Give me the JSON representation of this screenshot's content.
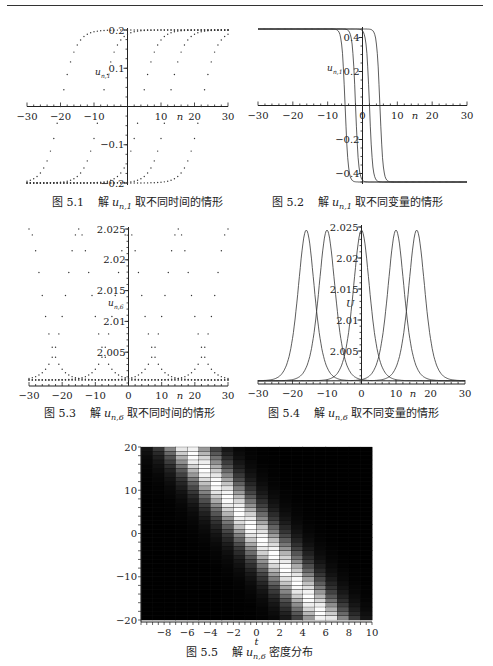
{
  "page": {
    "header_rule": true
  },
  "figures": [
    {
      "id": "5.1",
      "caption_num": "图 5.1",
      "caption_pre": "解",
      "caption_var": "u",
      "caption_sub": "n,1",
      "caption_post": "取不同时间的情形"
    },
    {
      "id": "5.2",
      "caption_num": "图 5.2",
      "caption_pre": "解",
      "caption_var": "u",
      "caption_sub": "n,1",
      "caption_post": "取不同变量的情形"
    },
    {
      "id": "5.3",
      "caption_num": "图 5.3",
      "caption_pre": "解",
      "caption_var": "u",
      "caption_sub": "n,6",
      "caption_post": "取不同时间的情形"
    },
    {
      "id": "5.4",
      "caption_num": "图 5.4",
      "caption_pre": "解",
      "caption_var": "u",
      "caption_sub": "n,6",
      "caption_post": "取不同变量的情形"
    },
    {
      "id": "5.5",
      "caption_num": "图 5.5",
      "caption_pre": "解",
      "caption_var": "u",
      "caption_sub": "n,6",
      "caption_post": "密度分布"
    }
  ],
  "chart_data": [
    {
      "figure": "5.1",
      "type": "scatter",
      "title": "图 5.1 解 u_{n,1} 取不同时间的情形",
      "xlabel": "n",
      "ylabel": "u_{n,1}",
      "xlim": [
        -30,
        30
      ],
      "ylim": [
        -0.2,
        0.2
      ],
      "xticks": [
        -30,
        -20,
        -10,
        10,
        20,
        30
      ],
      "yticks": [
        -0.2,
        -0.1,
        0.1,
        0.2
      ],
      "series": [
        {
          "name": "kink centered n≈-20",
          "center": -20,
          "amplitude": 0.2,
          "style": "dotted"
        },
        {
          "name": "kink centered n≈-8",
          "center": -8,
          "amplitude": 0.2,
          "style": "dotted"
        },
        {
          "name": "kink centered n≈4",
          "center": 4,
          "amplitude": 0.2,
          "style": "dotted"
        },
        {
          "name": "kink centered n≈12",
          "center": 12,
          "amplitude": 0.2,
          "style": "dotted"
        },
        {
          "name": "kink centered n≈22",
          "center": 22,
          "amplitude": 0.2,
          "style": "dotted"
        }
      ],
      "grid": false
    },
    {
      "figure": "5.2",
      "type": "line",
      "title": "图 5.2 解 u_{n,1} 取不同变量的情形",
      "xlabel": "n",
      "ylabel": "u_{n,1}",
      "xlim": [
        -30,
        30
      ],
      "ylim": [
        -0.45,
        0.45
      ],
      "xticks": [
        -30,
        -20,
        -10,
        0,
        10,
        20,
        30
      ],
      "yticks": [
        -0.4,
        -0.2,
        0.2,
        0.4
      ],
      "series": [
        {
          "name": "step at n≈-5",
          "center": -5,
          "high": 0.45,
          "low": -0.45
        },
        {
          "name": "step at n≈-2",
          "center": -2,
          "high": 0.45,
          "low": -0.45
        },
        {
          "name": "step at n≈2",
          "center": 2,
          "high": 0.45,
          "low": -0.45
        },
        {
          "name": "step at n≈5",
          "center": 5,
          "high": 0.45,
          "low": -0.45
        }
      ],
      "grid": false
    },
    {
      "figure": "5.3",
      "type": "scatter",
      "title": "图 5.3 解 u_{n,6} 取不同时间的情形",
      "xlabel": "n",
      "ylabel": "u_{n,6}",
      "xlim": [
        -30,
        30
      ],
      "ylim": [
        2.0,
        2.025
      ],
      "xticks": [
        -30,
        -20,
        -10,
        0,
        10,
        20,
        30
      ],
      "yticks": [
        2.005,
        2.01,
        2.015,
        2.02,
        2.025
      ],
      "series": [
        {
          "name": "soliton peak n≈-30",
          "peak_n": -30,
          "peak": 2.025,
          "base": 2.0005
        },
        {
          "name": "soliton peak n≈-15",
          "peak_n": -15,
          "peak": 2.025,
          "base": 2.0005
        },
        {
          "name": "soliton peak n≈0",
          "peak_n": 0,
          "peak": 2.025,
          "base": 2.0005
        },
        {
          "name": "soliton peak n≈15",
          "peak_n": 15,
          "peak": 2.025,
          "base": 2.0005
        },
        {
          "name": "soliton peak n≈30",
          "peak_n": 30,
          "peak": 2.025,
          "base": 2.0005
        }
      ],
      "grid": false
    },
    {
      "figure": "5.4",
      "type": "line",
      "title": "图 5.4 解 u_{n,6} 取不同变量的情形",
      "xlabel": "n",
      "ylabel": "U",
      "xlim": [
        -30,
        30
      ],
      "ylim": [
        2.0,
        2.025
      ],
      "xticks": [
        -30,
        -20,
        -10,
        0,
        10,
        20,
        30
      ],
      "yticks": [
        2.005,
        2.01,
        2.015,
        2.02,
        2.025
      ],
      "series": [
        {
          "name": "peak n≈-16",
          "peak_n": -16,
          "peak": 2.0245
        },
        {
          "name": "peak n≈-10",
          "peak_n": -10,
          "peak": 2.0245
        },
        {
          "name": "peak n≈0",
          "peak_n": 0,
          "peak": 2.0245
        },
        {
          "name": "peak n≈10",
          "peak_n": 10,
          "peak": 2.0245
        },
        {
          "name": "peak n≈16",
          "peak_n": 16,
          "peak": 2.0245
        }
      ],
      "grid": false
    },
    {
      "figure": "5.5",
      "type": "heatmap",
      "title": "图 5.5 解 u_{n,6} 密度分布",
      "xlabel": "t",
      "ylabel": "",
      "xlim": [
        -10,
        10
      ],
      "ylim": [
        -20,
        20
      ],
      "xticks": [
        -8,
        -6,
        -4,
        -2,
        0,
        2,
        4,
        6,
        8,
        10
      ],
      "yticks": [
        -20,
        -10,
        0,
        10,
        20
      ],
      "description": "Bright diagonal band from (t≈-6, n=20) to (t≈6, n=-20) on a black background; grayscale density",
      "ridge": {
        "slope_n_per_t": -3.3,
        "intercept_n": 0
      }
    }
  ]
}
